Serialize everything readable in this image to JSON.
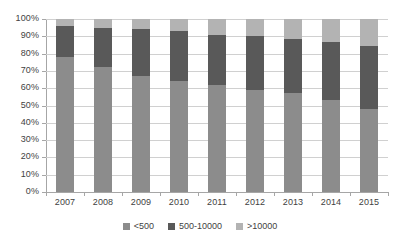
{
  "chart_data": {
    "type": "bar",
    "stacked": true,
    "normalized_percent": true,
    "title": "",
    "subtitle": "",
    "xlabel": "",
    "ylabel": "",
    "categories": [
      "2007",
      "2008",
      "2009",
      "2010",
      "2011",
      "2012",
      "2013",
      "2014",
      "2015"
    ],
    "ylim": [
      0,
      100
    ],
    "ytick_labels": [
      "0%",
      "10%",
      "20%",
      "30%",
      "40%",
      "50%",
      "60%",
      "70%",
      "80%",
      "90%",
      "100%"
    ],
    "ytick_values": [
      0,
      10,
      20,
      30,
      40,
      50,
      60,
      70,
      80,
      90,
      100
    ],
    "grid": true,
    "legend_position": "bottom-center",
    "series": [
      {
        "name": "<500",
        "color": "#8c8c8c",
        "values": [
          78,
          72,
          67,
          64,
          62,
          59,
          57,
          53,
          48
        ]
      },
      {
        "name": "500-10000",
        "color": "#595959",
        "values": [
          18,
          23,
          27,
          29,
          29,
          31,
          31.5,
          34,
          36.5
        ]
      },
      {
        "name": ">10000",
        "color": "#b3b3b3",
        "values": [
          4,
          5,
          6,
          7,
          9,
          10,
          11.5,
          13,
          15.5
        ]
      }
    ],
    "cumulative_tops": {
      "<500": [
        78,
        72,
        67,
        64,
        62,
        59,
        57,
        53,
        48
      ],
      "500-10000": [
        96,
        95,
        94,
        93,
        91,
        90,
        88.5,
        87,
        84.5
      ],
      ">10000": [
        100,
        100,
        100,
        100,
        100,
        100,
        100,
        100,
        100
      ]
    }
  },
  "legend": {
    "items": [
      {
        "label": "<500",
        "color": "#8c8c8c"
      },
      {
        "label": "500-10000",
        "color": "#595959"
      },
      {
        "label": ">10000",
        "color": "#b3b3b3"
      }
    ]
  },
  "colors": {
    "series_low": "#8c8c8c",
    "series_mid": "#595959",
    "series_high": "#b3b3b3",
    "gridline": "#d0d0d0",
    "axis": "#a6a6a6",
    "text": "#3f3f3f",
    "background": "#ffffff"
  }
}
